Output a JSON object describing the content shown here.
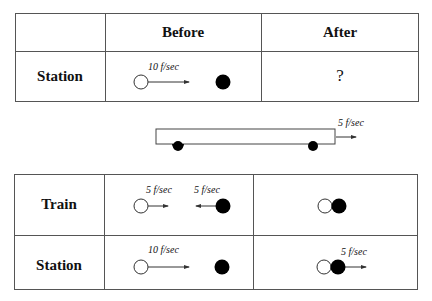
{
  "top_table": {
    "header": {
      "col1": "",
      "col2": "Before",
      "col3": "After"
    },
    "rows": [
      {
        "label": "Station",
        "before": {
          "moving_ball_velocity": "10 f/sec"
        },
        "after": "?"
      }
    ]
  },
  "train_figure": {
    "velocity_label": "5 f/sec"
  },
  "bottom_table": {
    "rows": [
      {
        "label": "Train",
        "before": {
          "left_velocity": "5 f/sec",
          "right_velocity": "5 f/sec"
        },
        "after": {
          "velocity": ""
        }
      },
      {
        "label": "Station",
        "before": {
          "left_velocity": "10 f/sec"
        },
        "after": {
          "velocity": "5 f/sec"
        }
      }
    ]
  },
  "colors": {
    "line": "#555555",
    "ball_filled": "#000000",
    "ball_hollow_fill": "#ffffff"
  }
}
